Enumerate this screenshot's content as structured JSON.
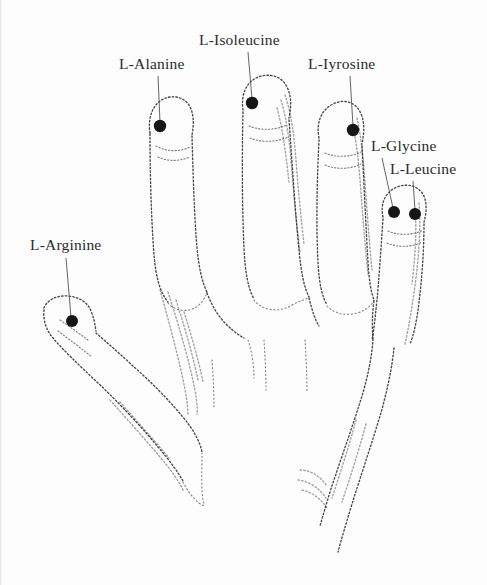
{
  "figure": {
    "background_color": "#fdfdfd",
    "ink_color": "#1f1f1f",
    "point_color": "#161616",
    "label_color": "#2b2b2b"
  },
  "labels": [
    {
      "id": "isoleucine",
      "text": "L-Isoleucine",
      "x": 199,
      "y": 31,
      "point": {
        "x": 252,
        "y": 103
      },
      "leader": {
        "x1": 248,
        "y1": 52,
        "x2": 252,
        "y2": 99
      }
    },
    {
      "id": "alanine",
      "text": "L-Alanine",
      "x": 119,
      "y": 55,
      "point": {
        "x": 160,
        "y": 126
      },
      "leader": {
        "x1": 158,
        "y1": 76,
        "x2": 160,
        "y2": 122
      }
    },
    {
      "id": "iyrosine",
      "text": "L-Iyrosine",
      "x": 308,
      "y": 55,
      "point": {
        "x": 353,
        "y": 130
      },
      "leader": {
        "x1": 350,
        "y1": 76,
        "x2": 353,
        "y2": 126
      }
    },
    {
      "id": "glycine",
      "text": "L-Glycine",
      "x": 371,
      "y": 137,
      "point": {
        "x": 394,
        "y": 212
      },
      "leader": {
        "x1": 382,
        "y1": 158,
        "x2": 393,
        "y2": 208
      }
    },
    {
      "id": "leucine",
      "text": "L-Leucine",
      "x": 390,
      "y": 160,
      "point": {
        "x": 415,
        "y": 214
      },
      "leader": {
        "x1": 413,
        "y1": 181,
        "x2": 415,
        "y2": 210
      }
    },
    {
      "id": "arginine",
      "text": "L-Arginine",
      "x": 30,
      "y": 236,
      "point": {
        "x": 72,
        "y": 321
      },
      "leader": {
        "x1": 66,
        "y1": 258,
        "x2": 71,
        "y2": 317
      }
    }
  ],
  "points_summary": {
    "count": 6,
    "radius_px": 6,
    "names": [
      "L-Isoleucine",
      "L-Alanine",
      "L-Iyrosine",
      "L-Glycine",
      "L-Leucine",
      "L-Arginine"
    ]
  }
}
